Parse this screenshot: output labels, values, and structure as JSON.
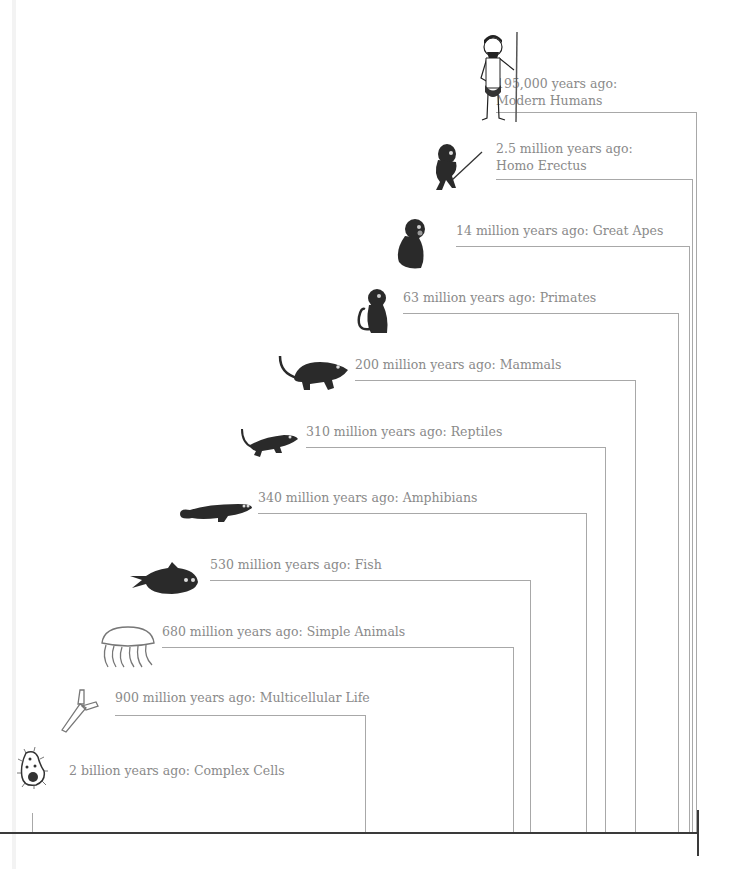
{
  "events": [
    {
      "id": "modern-humans",
      "line1": "195,000 years ago:",
      "line2": "Modern Humans",
      "icon": "caveman-icon"
    },
    {
      "id": "homo-erectus",
      "line1": "2.5 million years ago:",
      "line2": "Homo Erectus",
      "icon": "hominid-with-spear-icon"
    },
    {
      "id": "great-apes",
      "text": "14 million years ago: Great Apes",
      "icon": "ape-icon"
    },
    {
      "id": "primates",
      "text": "63 million years ago: Primates",
      "icon": "monkey-icon"
    },
    {
      "id": "mammals",
      "text": "200 million years ago: Mammals",
      "icon": "rodent-icon"
    },
    {
      "id": "reptiles",
      "text": "310 million years ago: Reptiles",
      "icon": "lizard-icon"
    },
    {
      "id": "amphibians",
      "text": "340 million years ago: Amphibians",
      "icon": "salamander-icon"
    },
    {
      "id": "fish",
      "text": "530 million years ago: Fish",
      "icon": "fish-icon"
    },
    {
      "id": "simple-animals",
      "text": "680 million years ago: Simple Animals",
      "icon": "jellyfish-icon"
    },
    {
      "id": "multicellular-life",
      "text": "900 million years ago: Multicellular Life",
      "icon": "multicellular-organism-icon"
    },
    {
      "id": "complex-cells",
      "text": "2 billion years ago: Complex Cells",
      "icon": "cell-icon"
    }
  ],
  "colors": {
    "text": "#8a8a8a",
    "lines": "#a8a8a8",
    "axis": "#3a3a3a",
    "silhouette": "#2a2a2a"
  }
}
